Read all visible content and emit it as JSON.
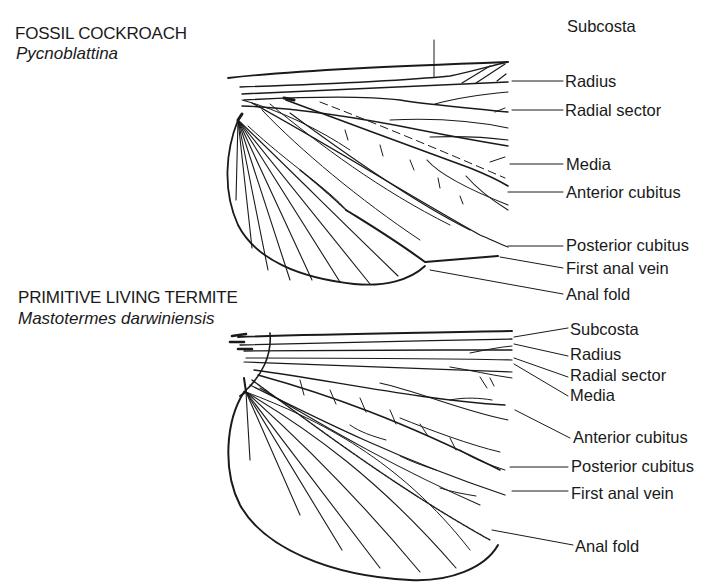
{
  "figure_type": "labeled comparative diagram of insect wing venation",
  "panels": [
    {
      "title": "FOSSIL COCKROACH",
      "species": "Pycnoblattina",
      "labels": [
        "Subcosta",
        "Radius",
        "Radial sector",
        "Media",
        "Anterior cubitus",
        "Posterior cubitus",
        "First anal vein",
        "Anal fold"
      ]
    },
    {
      "title": "PRIMITIVE LIVING TERMITE",
      "species": "Mastotermes darwiniensis",
      "labels": [
        "Subcosta",
        "Radius",
        "Radial sector",
        "Media",
        "Anterior cubitus",
        "Posterior cubitus",
        "First anal vein",
        "Anal fold"
      ]
    }
  ],
  "colors": {
    "ink": "#1a1a1a",
    "background": "#ffffff"
  }
}
